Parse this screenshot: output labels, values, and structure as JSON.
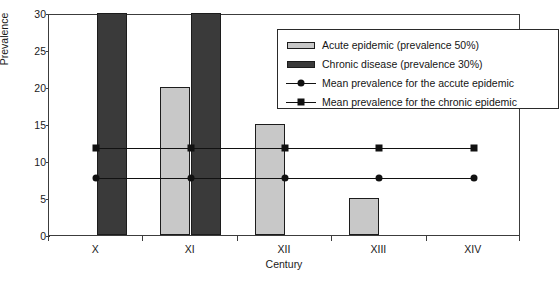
{
  "chart_data": {
    "type": "bar",
    "title": "",
    "xlabel": "Century",
    "ylabel": "Prevalence",
    "categories": [
      "X",
      "XI",
      "XII",
      "XIII",
      "XIV"
    ],
    "ylim": [
      0,
      30
    ],
    "yticks": [
      0,
      5,
      10,
      15,
      20,
      25,
      30
    ],
    "grid": false,
    "legend_position": "upper right",
    "series": [
      {
        "name": "Acute epidemic (prevalence 50%)",
        "kind": "bar",
        "color": "#c8c8c8",
        "values": [
          0,
          20,
          15,
          5,
          0
        ]
      },
      {
        "name": "Chronic disease (prevalence 30%)",
        "kind": "bar",
        "color": "#3a3a3a",
        "values": [
          30,
          30,
          0,
          0,
          0
        ]
      },
      {
        "name": "Mean prevalence for the accute epidemic",
        "kind": "line",
        "marker": "circle",
        "color": "#111111",
        "values": [
          8,
          8,
          8,
          8,
          8
        ]
      },
      {
        "name": "Mean prevalence for the chronic epidemic",
        "kind": "line",
        "marker": "square",
        "color": "#111111",
        "values": [
          12,
          12,
          12,
          12,
          12
        ]
      }
    ]
  },
  "axes": {
    "y_title": "Prevalence",
    "x_title": "Century",
    "y_tick_labels": [
      "30",
      "25",
      "20",
      "15",
      "10",
      "5",
      "0"
    ],
    "x_tick_labels": [
      "X",
      "XI",
      "XII",
      "XIII",
      "XIV"
    ]
  },
  "legend": {
    "entries": [
      {
        "label": "Acute epidemic (prevalence 50%)",
        "swatch": "bar-light"
      },
      {
        "label": "Chronic disease (prevalence 30%)",
        "swatch": "bar-dark"
      },
      {
        "label": "Mean prevalence for the accute epidemic",
        "swatch": "line-circle"
      },
      {
        "label": "Mean prevalence for the chronic epidemic",
        "swatch": "line-square"
      }
    ]
  },
  "colors": {
    "acute_bar": "#c8c8c8",
    "chronic_bar": "#3a3a3a",
    "line": "#111111",
    "axis": "#3c3c3c",
    "background": "#ffffff"
  }
}
